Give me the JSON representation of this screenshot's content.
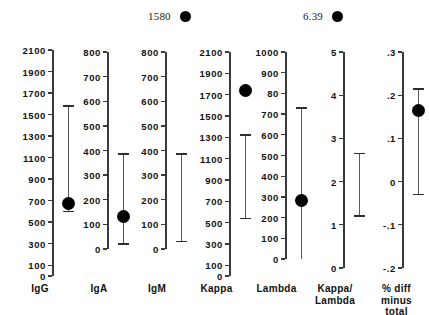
{
  "chart_data": {
    "type": "scatter",
    "title": "",
    "xlabel": "",
    "ylabel": "",
    "grid": false,
    "legend": "none",
    "annotations": [
      {
        "label": "1580",
        "note": "off-scale value marker for IgM panel"
      },
      {
        "label": "6.39",
        "note": "off-scale value marker for Kappa/Lambda panel"
      }
    ],
    "categories": [
      "IgG",
      "IgA",
      "IgM",
      "Kappa",
      "Lambda",
      "Kappa/\nLambda",
      "% diff\nminus\ntotal"
    ],
    "panels": [
      {
        "name": "IgG",
        "label": "IgG",
        "ylim": [
          0,
          2100
        ],
        "ticks": [
          0,
          100,
          300,
          500,
          700,
          900,
          1100,
          1300,
          1500,
          1700,
          1900,
          2100
        ],
        "ticklabels": [
          "0",
          "100",
          "300",
          "500",
          "700",
          "900",
          "1100",
          "1300",
          "1500",
          "1700",
          "1900",
          "2100"
        ],
        "value": 670,
        "range_low": 600,
        "range_high": 1580,
        "cap_low": true,
        "cap_high": true,
        "has_point": true,
        "offscale_value": null
      },
      {
        "name": "IgA",
        "label": "IgA",
        "ylim": [
          0,
          800
        ],
        "ticks": [
          0,
          100,
          200,
          300,
          400,
          500,
          600,
          700,
          800
        ],
        "ticklabels": [
          "0",
          "100",
          "200",
          "300",
          "400",
          "500",
          "600",
          "700",
          "800"
        ],
        "value": 130,
        "range_low": 20,
        "range_high": 385,
        "cap_low": true,
        "cap_high": true,
        "has_point": true,
        "offscale_value": null
      },
      {
        "name": "IgM",
        "label": "IgM",
        "ylim": [
          0,
          800
        ],
        "ticks": [
          0,
          100,
          200,
          300,
          400,
          500,
          600,
          700,
          800
        ],
        "ticklabels": [
          "0",
          "100",
          "200",
          "300",
          "400",
          "500",
          "600",
          "700",
          "800"
        ],
        "value": null,
        "range_low": 30,
        "range_high": 385,
        "cap_low": true,
        "cap_high": true,
        "has_point": false,
        "offscale_value": "1580"
      },
      {
        "name": "Kappa",
        "label": "Kappa",
        "ylim": [
          0,
          2100
        ],
        "ticks": [
          0,
          100,
          300,
          500,
          700,
          900,
          1100,
          1300,
          1500,
          1700,
          1900,
          2100
        ],
        "ticklabels": [
          "0",
          "100",
          "300",
          "500",
          "700",
          "900",
          "1100",
          "1300",
          "1500",
          "1700",
          "1900",
          "2100"
        ],
        "value": 1740,
        "range_low": 540,
        "range_high": 1320,
        "cap_low": true,
        "cap_high": true,
        "has_point": true,
        "offscale_value": null
      },
      {
        "name": "Lambda",
        "label": "Lambda",
        "ylim": [
          0,
          1000
        ],
        "ticks": [
          0,
          100,
          200,
          300,
          400,
          500,
          600,
          700,
          800,
          900,
          1000
        ],
        "ticklabels": [
          "0",
          "100",
          "200",
          "300",
          "400",
          "500",
          "600",
          "700",
          "80",
          "900",
          "1000"
        ],
        "value": 285,
        "range_low": 0,
        "range_high": 730,
        "cap_low": false,
        "cap_high": true,
        "has_point": true,
        "offscale_value": null
      },
      {
        "name": "KappaLambda",
        "label": "Kappa/\nLambda",
        "ylim": [
          0,
          5
        ],
        "ticks": [
          0,
          1,
          2,
          3,
          4,
          5
        ],
        "ticklabels": [
          "0",
          "1",
          "2",
          "3",
          "4",
          "5"
        ],
        "value": null,
        "range_low": 1.2,
        "range_high": 2.65,
        "cap_low": true,
        "cap_high": true,
        "has_point": false,
        "offscale_value": "6.39"
      },
      {
        "name": "PctDiffMinusTotal",
        "label": "% diff\nminus\ntotal",
        "ylim": [
          -0.2,
          0.3
        ],
        "ticks": [
          -0.2,
          -0.1,
          0,
          0.1,
          0.2,
          0.3
        ],
        "ticklabels": [
          "-.2",
          "-.1",
          "0",
          ".1",
          ".2",
          ".3"
        ],
        "value": 0.165,
        "range_low": -0.03,
        "range_high": 0.215,
        "cap_low": true,
        "cap_high": true,
        "has_point": true,
        "offscale_value": null
      }
    ]
  },
  "colors": {
    "marker": "#000000",
    "axis": "#3a3a3a",
    "bar": "#5a5a5a",
    "text": "#101010",
    "background": "#ffffff"
  }
}
